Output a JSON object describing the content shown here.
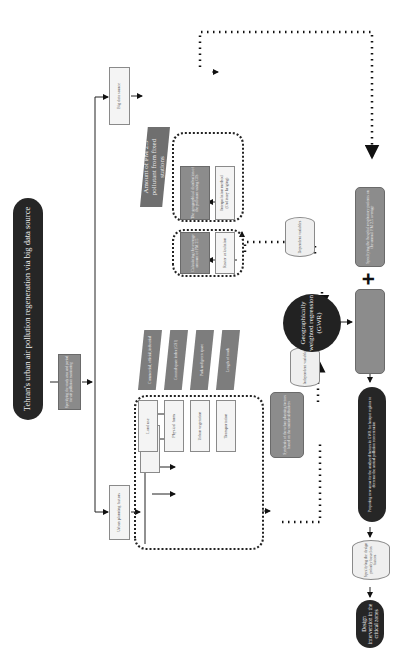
{
  "diagram": {
    "title": "Tehran's urban air pollution regeneration via big data source",
    "intro_box": "Specifying the study area and period for air pollution monitoring",
    "branches": {
      "urban": "Urban planning factors",
      "bigdata": "Big data source"
    },
    "urban_factors": [
      {
        "factor": "Land use",
        "indicator": "Commercial, official, industrial"
      },
      {
        "factor": "Physical form",
        "indicator": "Ground space index (GSI)"
      },
      {
        "factor": "Urban vegetation",
        "indicator": "Park and green space"
      },
      {
        "factor": "Transportation",
        "indicator": "Length of roads"
      }
    ],
    "urban_summary": "Synthesis of the urban planning factors based on the statistical districts",
    "independent_var": "Independent variables",
    "pm_source": "Amount of PM 2.5 pollutant from fixed stations",
    "bigdata_steps": [
      {
        "process": "The geographical distribution of the pollutant using GIS",
        "method": "Interpolation method (Ordinary kriging)"
      },
      {
        "process": "Calculating the average amount of PM 2.5",
        "method": "Raster calculation"
      }
    ],
    "dependent_var": "Dependent variables",
    "gwr": "Geographically weighted regression (GWR)",
    "relationship_box": "Identifying the significant relationships between PM 2.5 and the statistics",
    "hospital_box": "Specifying the hospital respiratory patients on the annual PM 2.5 average",
    "plus_symbol": "+",
    "proposal": "Proposing new areas for the analyzed factors in GWR for hotspot regions to decrease the annual pollution concentration",
    "specify_box": "Specifying the design priority based on factors",
    "final": "Design intervention in the critical zones"
  }
}
